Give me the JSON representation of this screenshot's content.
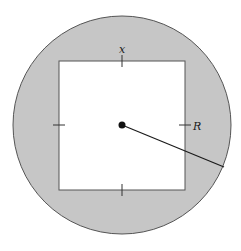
{
  "diagram": {
    "labels": {
      "side": "x",
      "radius": "R"
    },
    "colors": {
      "circle_fill": "#c6c6c6",
      "circle_stroke": "#555555",
      "square_fill": "#ffffff",
      "square_stroke": "#555555",
      "line": "#1a1a1a",
      "dot": "#111111"
    },
    "geometry": {
      "circle": {
        "cx": 122,
        "cy": 125,
        "r": 109
      },
      "square": {
        "x": 59,
        "y": 61,
        "width": 126,
        "height": 129
      },
      "center_dot": {
        "cx": 122,
        "cy": 125,
        "r": 3.5
      },
      "radius_line": {
        "x1": 122,
        "y1": 125,
        "x2": 224,
        "y2": 167
      },
      "tick_marks": [
        {
          "side": "top",
          "x1": 122,
          "y1": 55,
          "x2": 122,
          "y2": 67
        },
        {
          "side": "bottom",
          "x1": 122,
          "y1": 184,
          "x2": 122,
          "y2": 196
        },
        {
          "side": "left",
          "x1": 53,
          "y1": 125,
          "x2": 65,
          "y2": 125
        },
        {
          "side": "right",
          "x1": 179,
          "y1": 125,
          "x2": 191,
          "y2": 125
        }
      ]
    }
  }
}
